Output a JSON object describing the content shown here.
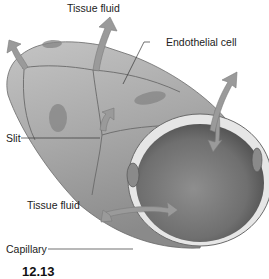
{
  "figure": {
    "number_partial": "12.13"
  },
  "labels": {
    "tissue_fluid_top": "Tissue fluid",
    "endothelial_cell": "Endothelial cell",
    "slit": "Slit",
    "tissue_fluid_bottom": "Tissue fluid",
    "capillary": "Capillary"
  },
  "colors": {
    "background": "#ffffff",
    "tube_outer": "#a9a9a9",
    "tube_shadow": "#7d7d7d",
    "lumen_dark": "#6e6e6e",
    "wall_rim": "#e6e6e6",
    "arrow_fill": "#9a9a9a",
    "cell_border": "#6a6a6a",
    "nucleus": "#858585",
    "label_text": "#222222"
  }
}
